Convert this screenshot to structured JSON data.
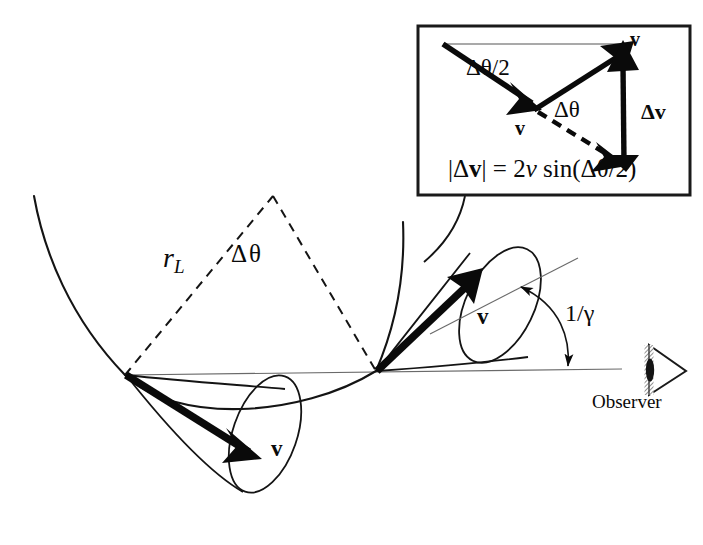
{
  "figure": {
    "background_color": "#ffffff",
    "ink_color": "#0a0a0a",
    "width": 703,
    "height": 545
  },
  "inset": {
    "name": "velocity-change-inset",
    "border_color": "#1a1a1a",
    "labels": {
      "half_angle": "Δθ/2",
      "delta_theta": "Δθ",
      "v_initial": "v",
      "v_final": "v",
      "delta_v": "Δv"
    },
    "formula": {
      "lhs_abs_open": "|Δ",
      "lhs_vec": "v",
      "lhs_abs_close": "|",
      "equals": "=",
      "coefficient": "2",
      "speed": "v",
      "function": "sin(",
      "argument": "Δθ/2",
      "close": ")",
      "plain": "|Δv| = 2v sin(Δθ/2)"
    }
  },
  "main": {
    "labels": {
      "larmor_radius": "r",
      "larmor_radius_subscript": "L",
      "delta_theta": "Δθ",
      "velocity_left": "v",
      "velocity_right": "v",
      "beaming_angle": "1/γ",
      "observer": "Observer"
    },
    "elements": {
      "trajectory": "helical-particle-trajectory",
      "chord_triangle": "dashed-chord-triangle",
      "left_cone": "left-emission-cone",
      "right_cone": "right-emission-cone",
      "axis": "line-of-sight-axis",
      "observer_icon": "observer-eye-icon",
      "leader": "inset-leader-line"
    }
  }
}
